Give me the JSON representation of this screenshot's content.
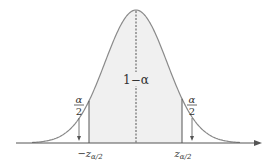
{
  "diagram": {
    "type": "normal-distribution-two-tailed",
    "center_label": "1−α",
    "tail_label_num": "α",
    "tail_label_den": "2",
    "left_critical_main": "−z",
    "left_critical_sub": "α/2",
    "right_critical_main": "z",
    "right_critical_sub": "α/2",
    "colors": {
      "curve": "#8a8a8a",
      "shading": "#f0f0f0",
      "axis": "#555555",
      "lines": "#555555"
    }
  }
}
